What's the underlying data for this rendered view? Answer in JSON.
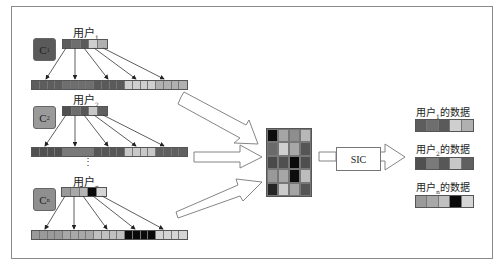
{
  "diagram": {
    "frame": {
      "border_color": "#8a8a8a"
    },
    "users": [
      {
        "code_label": "C",
        "code_sub": "1",
        "code_color": "#5a5a5a",
        "user_label": "用户",
        "user_sub": "1",
        "user_bar": [
          "#5d5d5d",
          "#6e6e6e",
          "#5a5a5a",
          "#cfcfcf",
          "#b0b0b0"
        ],
        "spread_bar": [
          "#5d5d5d",
          "#5d5d5d",
          "#5d5d5d",
          "#5d5d5d",
          "#6e6e6e",
          "#6e6e6e",
          "#6e6e6e",
          "#6e6e6e",
          "#5a5a5a",
          "#5a5a5a",
          "#5a5a5a",
          "#5a5a5a",
          "#cfcfcf",
          "#cfcfcf",
          "#cfcfcf",
          "#cfcfcf",
          "#b0b0b0",
          "#b0b0b0",
          "#b0b0b0",
          "#b0b0b0"
        ]
      },
      {
        "code_label": "C",
        "code_sub": "2",
        "code_color": "#9a9a9a",
        "user_label": "用户",
        "user_sub": "2",
        "user_bar": [
          "#505050",
          "#6e6e6e",
          "#575757",
          "#c8c8c8",
          "#606060"
        ],
        "spread_bar": [
          "#505050",
          "#505050",
          "#505050",
          "#505050",
          "#7a7a7a",
          "#7a7a7a",
          "#7a7a7a",
          "#7a7a7a",
          "#575757",
          "#575757",
          "#575757",
          "#575757",
          "#c8c8c8",
          "#c8c8c8",
          "#c8c8c8",
          "#c8c8c8",
          "#606060",
          "#606060",
          "#606060",
          "#606060"
        ]
      },
      {
        "code_label": "C",
        "code_sub": "n",
        "code_color": "#8f8f8f",
        "user_label": "用户",
        "user_sub": "n",
        "user_bar": [
          "#9a9a9a",
          "#a8a8a8",
          "#b5b5b5",
          "#0a0a0a",
          "#d5d5d5"
        ],
        "spread_bar": [
          "#9a9a9a",
          "#9a9a9a",
          "#9a9a9a",
          "#9a9a9a",
          "#a8a8a8",
          "#a8a8a8",
          "#a8a8a8",
          "#a8a8a8",
          "#c0c0c0",
          "#c0c0c0",
          "#c0c0c0",
          "#c0c0c0",
          "#0a0a0a",
          "#0a0a0a",
          "#0a0a0a",
          "#0a0a0a",
          "#d5d5d5",
          "#d5d5d5",
          "#d5d5d5",
          "#d5d5d5"
        ]
      }
    ],
    "ellipsis": "⋮",
    "combined_grid": [
      [
        "#0d0d0d",
        "#a5a5a5",
        "#8e8e8e",
        "#b8b8b8"
      ],
      [
        "#6a6a6a",
        "#d0d0d0",
        "#a8a8a8",
        "#555555"
      ],
      [
        "#4a4a4a",
        "#505050",
        "#0a0a0a",
        "#4e4e4e"
      ],
      [
        "#999999",
        "#a6a6a6",
        "#0d0d0d",
        "#bdbdbd"
      ],
      [
        "#262626",
        "#cccccc",
        "#a5a5a5",
        "#555555"
      ]
    ],
    "decoder": {
      "label": "SIC"
    },
    "outputs": [
      {
        "label_pre": "用户",
        "label_sub": "1",
        "label_post": "的数据",
        "bar": [
          "#5d5d5d",
          "#6e6e6e",
          "#5a5a5a",
          "#cfcfcf",
          "#b0b0b0"
        ]
      },
      {
        "label_pre": "用户",
        "label_sub": "2",
        "label_post": "的数据",
        "bar": [
          "#505050",
          "#7a7a7a",
          "#575757",
          "#c8c8c8",
          "#606060"
        ]
      },
      {
        "label_pre": "用户",
        "label_sub": "n",
        "label_post": "的数据",
        "bar": [
          "#9a9a9a",
          "#a8a8a8",
          "#c0c0c0",
          "#0a0a0a",
          "#d5d5d5"
        ]
      }
    ]
  }
}
